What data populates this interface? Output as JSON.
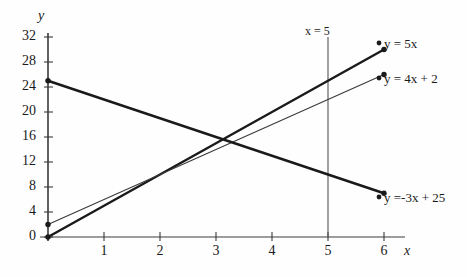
{
  "chart_data": {
    "type": "line",
    "title": "",
    "xlabel": "x",
    "ylabel": "y",
    "xlim": [
      0,
      6.4
    ],
    "ylim": [
      0,
      32
    ],
    "xticks": [
      "1",
      "2",
      "3",
      "4",
      "5",
      "6"
    ],
    "xtick_values": [
      1,
      2,
      3,
      4,
      5,
      6
    ],
    "yticks": [
      "0",
      "4",
      "8",
      "12",
      "16",
      "20",
      "24",
      "28",
      "32"
    ],
    "ytick_values": [
      0,
      4,
      8,
      12,
      16,
      20,
      24,
      28,
      32
    ],
    "grid": false,
    "legend_position": "right-of-line-endpoints",
    "series": [
      {
        "name": "y = 5x",
        "label": "y = 5x",
        "slope": 5,
        "intercept": 0,
        "x": [
          0,
          6
        ],
        "values": [
          0,
          30
        ],
        "endpoint_markers": [
          [
            0,
            0
          ],
          [
            6,
            30
          ]
        ],
        "stroke": "#1a1a1a",
        "width": 2.4
      },
      {
        "name": "y = 4x + 2",
        "label": "y = 4x + 2",
        "slope": 4,
        "intercept": 2,
        "x": [
          0,
          6
        ],
        "values": [
          2,
          26
        ],
        "endpoint_markers": [
          [
            0,
            2
          ],
          [
            6,
            26
          ]
        ],
        "stroke": "#3a3a3a",
        "width": 1.1
      },
      {
        "name": "y = -3x + 25",
        "label": "y =-3x + 25",
        "slope": -3,
        "intercept": 25,
        "x": [
          0,
          6
        ],
        "values": [
          25,
          7
        ],
        "endpoint_markers": [
          [
            0,
            25
          ],
          [
            6,
            7
          ]
        ],
        "stroke": "#1a1a1a",
        "width": 2.4
      }
    ],
    "annotations": [
      {
        "name": "vertical-line-x5",
        "label": "x = 5",
        "type": "vline",
        "x": 5,
        "y_from": 0,
        "y_to": 32,
        "stroke": "#555555",
        "width": 1.1
      }
    ]
  },
  "axes": {
    "y_axis_label": "y",
    "x_axis_label": "x",
    "axis_color": "#3a3a3a"
  },
  "labels": {
    "eq_5x": "y = 5x",
    "eq_4x2": "y = 4x + 2",
    "eq_n3x25": "y =-3x + 25",
    "vline": "x = 5"
  }
}
